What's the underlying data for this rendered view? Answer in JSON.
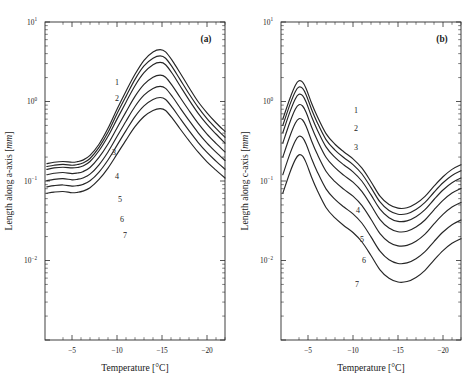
{
  "figure": {
    "background": "#ffffff",
    "curve_color": "#262626",
    "axis_color": "#2b2b2b"
  },
  "panels": [
    {
      "id": "a",
      "label": "(a)",
      "xlabel_pre": "Temperature [",
      "xlabel_unit": "°C]",
      "ylabel_pre": "Length along a-axis [",
      "ylabel_unit": "mm",
      "ylabel_post": "]",
      "xticks": [
        -5,
        -10,
        -15,
        -20
      ],
      "xticklabels": [
        "−5",
        "−10",
        "−15",
        "−20"
      ],
      "yticklabels": [
        {
          "mant": "10",
          "exp": "1"
        },
        {
          "mant": "10",
          "exp": "0"
        },
        {
          "mant": "10",
          "exp": "−1"
        },
        {
          "mant": "10",
          "exp": "−2"
        }
      ],
      "curve_labels": [
        "1",
        "2",
        "3",
        "4",
        "5",
        "6",
        "7"
      ]
    },
    {
      "id": "b",
      "label": "(b)",
      "xlabel_pre": "Temperature [",
      "xlabel_unit": "°C]",
      "ylabel_pre": "Length along c-axis [",
      "ylabel_unit": "mm",
      "ylabel_post": "]",
      "xticks": [
        -5,
        -10,
        -15,
        -20
      ],
      "xticklabels": [
        "−5",
        "−10",
        "−15",
        "−20"
      ],
      "yticklabels": [
        {
          "mant": "10",
          "exp": "1"
        },
        {
          "mant": "10",
          "exp": "0"
        },
        {
          "mant": "10",
          "exp": "−1"
        },
        {
          "mant": "10",
          "exp": "−2"
        }
      ],
      "curve_labels": [
        "1",
        "2",
        "3",
        "4",
        "5",
        "6",
        "7"
      ]
    }
  ],
  "chart_data": [
    {
      "type": "line",
      "panel": "a",
      "title": "(a)",
      "xlabel": "Temperature [°C]",
      "ylabel": "Length along a-axis [mm]",
      "xlim": [
        -2,
        -22
      ],
      "ylim": [
        0.001,
        10
      ],
      "yscale": "log",
      "xscale": "linear",
      "grid": false,
      "legend": "inline-curve-numbers",
      "x": [
        -2.2,
        -3.0,
        -4.0,
        -5.0,
        -5.6,
        -6.2,
        -7.0,
        -8.0,
        -9.0,
        -10.0,
        -11.0,
        -12.0,
        -13.0,
        -14.0,
        -14.8,
        -15.4,
        -16.2,
        -17.0,
        -18.0,
        -19.0,
        -20.0,
        -21.0,
        -22.0
      ],
      "series": [
        {
          "name": "1",
          "values": [
            0.165,
            0.172,
            0.176,
            0.172,
            0.175,
            0.183,
            0.21,
            0.29,
            0.46,
            0.8,
            1.35,
            2.2,
            3.3,
            4.2,
            4.5,
            4.2,
            3.2,
            2.3,
            1.5,
            1.0,
            0.72,
            0.54,
            0.42
          ]
        },
        {
          "name": "2",
          "values": [
            0.152,
            0.158,
            0.162,
            0.158,
            0.161,
            0.168,
            0.192,
            0.265,
            0.41,
            0.7,
            1.16,
            1.9,
            2.8,
            3.5,
            3.75,
            3.5,
            2.65,
            1.9,
            1.25,
            0.85,
            0.61,
            0.46,
            0.355
          ]
        },
        {
          "name": "3",
          "values": [
            0.14,
            0.146,
            0.149,
            0.146,
            0.148,
            0.154,
            0.176,
            0.24,
            0.365,
            0.6,
            0.98,
            1.58,
            2.3,
            2.9,
            3.1,
            2.9,
            2.2,
            1.58,
            1.05,
            0.715,
            0.515,
            0.39,
            0.3
          ]
        },
        {
          "name": "4",
          "values": [
            0.12,
            0.125,
            0.128,
            0.124,
            0.126,
            0.131,
            0.148,
            0.198,
            0.292,
            0.465,
            0.74,
            1.16,
            1.64,
            2.02,
            2.15,
            2.02,
            1.55,
            1.13,
            0.77,
            0.535,
            0.39,
            0.298,
            0.232
          ]
        },
        {
          "name": "5",
          "values": [
            0.101,
            0.105,
            0.107,
            0.1035,
            0.105,
            0.109,
            0.122,
            0.16,
            0.232,
            0.362,
            0.565,
            0.865,
            1.2,
            1.46,
            1.55,
            1.46,
            1.13,
            0.835,
            0.578,
            0.407,
            0.3,
            0.231,
            0.181
          ]
        },
        {
          "name": "6",
          "values": [
            0.0845,
            0.0875,
            0.0892,
            0.0862,
            0.0873,
            0.0905,
            0.1005,
            0.1295,
            0.184,
            0.281,
            0.43,
            0.645,
            0.88,
            1.06,
            1.122,
            1.06,
            0.825,
            0.615,
            0.43,
            0.307,
            0.229,
            0.178,
            0.1405
          ]
        },
        {
          "name": "7",
          "values": [
            0.07,
            0.0725,
            0.0738,
            0.0712,
            0.072,
            0.0745,
            0.0822,
            0.1045,
            0.1455,
            0.2175,
            0.327,
            0.482,
            0.648,
            0.772,
            0.815,
            0.772,
            0.605,
            0.4545,
            0.3215,
            0.232,
            0.1745,
            0.137,
            0.109
          ]
        }
      ]
    },
    {
      "type": "line",
      "panel": "b",
      "title": "(b)",
      "xlabel": "Temperature [°C]",
      "ylabel": "Length along c-axis [mm]",
      "xlim": [
        -2,
        -22
      ],
      "ylim": [
        0.001,
        10
      ],
      "yscale": "log",
      "xscale": "linear",
      "grid": false,
      "legend": "inline-curve-numbers",
      "x": [
        -2.2,
        -3.0,
        -3.6,
        -4.0,
        -4.4,
        -4.8,
        -5.4,
        -6.0,
        -7.0,
        -8.0,
        -9.0,
        -10.0,
        -11.0,
        -12.0,
        -13.0,
        -14.0,
        -15.0,
        -16.0,
        -17.0,
        -18.0,
        -19.0,
        -20.0,
        -21.0,
        -22.0
      ],
      "series": [
        {
          "name": "1",
          "values": [
            0.6,
            1.1,
            1.6,
            1.82,
            1.75,
            1.45,
            0.95,
            0.66,
            0.395,
            0.29,
            0.232,
            0.19,
            0.145,
            0.098,
            0.0645,
            0.0505,
            0.0455,
            0.046,
            0.052,
            0.064,
            0.086,
            0.113,
            0.14,
            0.16
          ]
        },
        {
          "name": "2",
          "values": [
            0.5,
            0.92,
            1.34,
            1.52,
            1.46,
            1.21,
            0.795,
            0.553,
            0.332,
            0.245,
            0.196,
            0.161,
            0.1225,
            0.0825,
            0.0545,
            0.0425,
            0.0382,
            0.0388,
            0.0438,
            0.0538,
            0.0722,
            0.095,
            0.1175,
            0.1345
          ]
        },
        {
          "name": "3",
          "values": [
            0.405,
            0.745,
            1.085,
            1.232,
            1.185,
            0.98,
            0.645,
            0.448,
            0.269,
            0.1985,
            0.1588,
            0.1305,
            0.0993,
            0.0668,
            0.0442,
            0.0345,
            0.031,
            0.0315,
            0.0355,
            0.0436,
            0.0585,
            0.077,
            0.0952,
            0.109
          ]
        },
        {
          "name": "4",
          "values": [
            0.3,
            0.552,
            0.803,
            0.912,
            0.878,
            0.726,
            0.478,
            0.332,
            0.1992,
            0.147,
            0.1176,
            0.0966,
            0.0735,
            0.0495,
            0.0327,
            0.0256,
            0.023,
            0.0233,
            0.0263,
            0.0323,
            0.0433,
            0.057,
            0.0705,
            0.0807
          ]
        },
        {
          "name": "5",
          "values": [
            0.2,
            0.368,
            0.535,
            0.608,
            0.585,
            0.484,
            0.319,
            0.221,
            0.1328,
            0.098,
            0.0784,
            0.0644,
            0.049,
            0.033,
            0.0218,
            0.017,
            0.0153,
            0.0155,
            0.0175,
            0.0215,
            0.0289,
            0.038,
            0.047,
            0.0538
          ]
        },
        {
          "name": "6",
          "values": [
            0.12,
            0.221,
            0.321,
            0.365,
            0.351,
            0.29,
            0.1912,
            0.1328,
            0.0797,
            0.0588,
            0.047,
            0.0386,
            0.0294,
            0.0198,
            0.0131,
            0.0102,
            0.00918,
            0.00932,
            0.01052,
            0.01292,
            0.01733,
            0.0228,
            0.0282,
            0.03228
          ]
        },
        {
          "name": "7",
          "values": [
            0.07,
            0.129,
            0.187,
            0.213,
            0.205,
            0.169,
            0.1116,
            0.0774,
            0.0465,
            0.0343,
            0.0274,
            0.0225,
            0.0171,
            0.01155,
            0.00763,
            0.00597,
            0.00536,
            0.00544,
            0.00613,
            0.00753,
            0.01011,
            0.0133,
            0.01645,
            0.01883
          ]
        }
      ]
    }
  ]
}
